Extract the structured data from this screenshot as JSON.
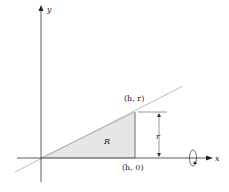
{
  "diagram": {
    "axes": {
      "x_label": "x",
      "y_label": "y"
    },
    "points": {
      "top": "(h, r)",
      "bottom": "(h, 0)"
    },
    "region_label": "R",
    "height_label": "r",
    "colors": {
      "region_fill": "#e6e6e6",
      "line": "#aaaaaa",
      "axis": "#333333"
    }
  }
}
